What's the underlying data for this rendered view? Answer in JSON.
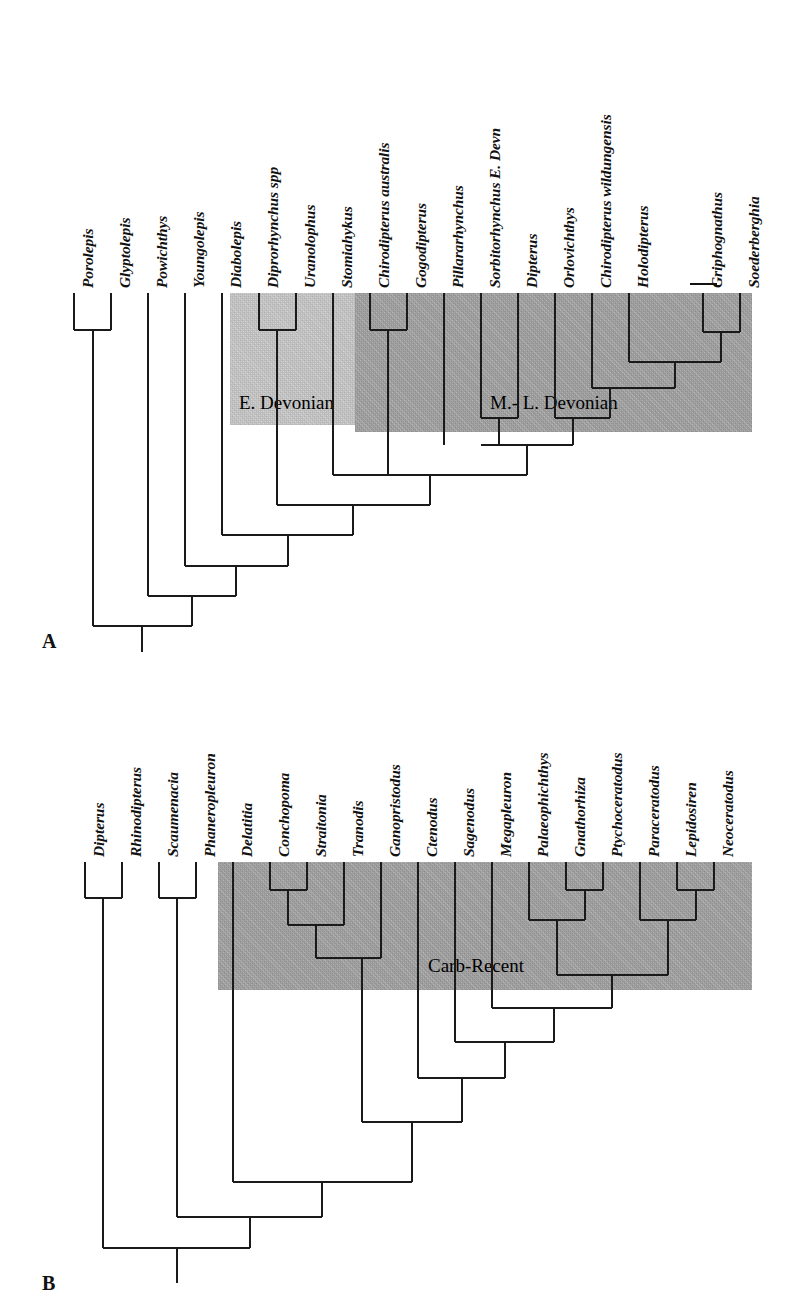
{
  "figure": {
    "type": "cladogram",
    "panels": [
      {
        "letter": "A",
        "letter_pos": {
          "x": 42,
          "y": 630
        },
        "tip_spacing": 37,
        "tip_x0": 74,
        "tip_top": 293,
        "label_baseline_y": 288,
        "taxa": [
          {
            "name": "Porolepis",
            "tip_x": 74,
            "label_y": 288,
            "style": "italic"
          },
          {
            "name": "Glyptolepis",
            "tip_x": 111,
            "label_y": 288,
            "style": "italic"
          },
          {
            "name": "Powichthys",
            "tip_x": 148,
            "label_y": 288,
            "style": "italic"
          },
          {
            "name": "Youngolepis",
            "tip_x": 185,
            "label_y": 288,
            "style": "italic"
          },
          {
            "name": "Diabolepis",
            "tip_x": 222,
            "label_y": 288,
            "style": "italic"
          },
          {
            "name": "Diprorhynchus spp",
            "tip_x": 259,
            "label_y": 288,
            "style": "italic-mixed"
          },
          {
            "name": "Uranolophus",
            "tip_x": 296,
            "label_y": 288,
            "style": "italic"
          },
          {
            "name": "Stomiahykus",
            "tip_x": 333,
            "label_y": 288,
            "style": "italic"
          },
          {
            "name": "Chirodipterus australis",
            "tip_x": 370,
            "label_y": 288,
            "style": "italic"
          },
          {
            "name": "Gogodipterus",
            "tip_x": 407,
            "label_y": 288,
            "style": "italic"
          },
          {
            "name": "Pillararhynchus",
            "tip_x": 444,
            "label_y": 288,
            "style": "italic"
          },
          {
            "name": "Sorbitorhynchus E. Devn",
            "tip_x": 481,
            "label_y": 288,
            "style": "italic-mixed"
          },
          {
            "name": "Dipterus",
            "tip_x": 518,
            "label_y": 288,
            "style": "italic"
          },
          {
            "name": "Orlovichthys",
            "tip_x": 555,
            "label_y": 288,
            "style": "italic"
          },
          {
            "name": "Chirodipterus wildungensis",
            "tip_x": 592,
            "label_y": 288,
            "style": "italic"
          },
          {
            "name": "Holodipterus",
            "tip_x": 629,
            "label_y": 288,
            "style": "italic"
          },
          {
            "name": "Griphognathus",
            "tip_x": 703,
            "label_y": 288,
            "style": "italic"
          },
          {
            "name": "Soederberghia",
            "tip_x": 740,
            "label_y": 288,
            "style": "italic"
          }
        ],
        "bands": [
          {
            "id": "e-devonian",
            "label": "E. Devonian",
            "x": 230,
            "y": 293,
            "w": 125,
            "h": 132,
            "color": "#c9c9c9",
            "label_x": 239,
            "label_y": 392
          },
          {
            "id": "ml-devonian",
            "label": "M.- L. Devonian",
            "x": 355,
            "y": 293,
            "w": 397,
            "h": 139,
            "color": "#a3a3a3",
            "label_x": 490,
            "label_y": 392
          }
        ],
        "bracket": {
          "id": "griphognathus-bracket",
          "x": 690,
          "y": 283,
          "w": 27
        }
      },
      {
        "letter": "B",
        "letter_pos": {
          "x": 42,
          "y": 1272
        },
        "tip_spacing": 37,
        "tip_x0": 85,
        "tip_top": 862,
        "label_baseline_y": 857,
        "taxa": [
          {
            "name": "Dipterus",
            "tip_x": 85,
            "label_y": 857,
            "style": "italic"
          },
          {
            "name": "Rhinodipterus",
            "tip_x": 122,
            "label_y": 857,
            "style": "italic"
          },
          {
            "name": "Scaumenacia",
            "tip_x": 159,
            "label_y": 857,
            "style": "italic"
          },
          {
            "name": "Phaneropleuron",
            "tip_x": 196,
            "label_y": 857,
            "style": "italic"
          },
          {
            "name": "Delatitia",
            "tip_x": 233,
            "label_y": 857,
            "style": "italic"
          },
          {
            "name": "Conchopoma",
            "tip_x": 270,
            "label_y": 857,
            "style": "italic"
          },
          {
            "name": "Straitonia",
            "tip_x": 307,
            "label_y": 857,
            "style": "italic"
          },
          {
            "name": "Tranodis",
            "tip_x": 344,
            "label_y": 857,
            "style": "italic"
          },
          {
            "name": "Ganopristodus",
            "tip_x": 381,
            "label_y": 857,
            "style": "italic"
          },
          {
            "name": "Ctenodus",
            "tip_x": 418,
            "label_y": 857,
            "style": "italic"
          },
          {
            "name": "Sagenodus",
            "tip_x": 455,
            "label_y": 857,
            "style": "italic"
          },
          {
            "name": "Megapleuron",
            "tip_x": 492,
            "label_y": 857,
            "style": "italic"
          },
          {
            "name": "Palaeophichthys",
            "tip_x": 529,
            "label_y": 857,
            "style": "italic"
          },
          {
            "name": "Gnathorhiza",
            "tip_x": 566,
            "label_y": 857,
            "style": "italic"
          },
          {
            "name": "Ptychoceratodus",
            "tip_x": 603,
            "label_y": 857,
            "style": "italic"
          },
          {
            "name": "Paraceratodus",
            "tip_x": 640,
            "label_y": 857,
            "style": "italic"
          },
          {
            "name": "Lepidosiren",
            "tip_x": 677,
            "label_y": 857,
            "style": "italic"
          },
          {
            "name": "Neoceratodus",
            "tip_x": 714,
            "label_y": 857,
            "style": "italic"
          }
        ],
        "bands": [
          {
            "id": "carb-recent",
            "label": "Carb-Recent",
            "x": 218,
            "y": 862,
            "w": 534,
            "h": 128,
            "color": "#a3a3a3",
            "label_x": 428,
            "label_y": 955
          }
        ]
      }
    ]
  },
  "chart_data": {
    "type": "cladogram",
    "title": "",
    "panels": [
      {
        "panel": "A",
        "taxa_order": [
          "Porolepis",
          "Glyptolepis",
          "Powichthys",
          "Youngolepis",
          "Diabolepis",
          "Diprorhynchus spp",
          "Uranolophus",
          "Stomiahykus",
          "Chirodipterus australis",
          "Gogodipterus",
          "Pillararhynchus",
          "Sorbitorhynchus E. Devn",
          "Dipterus",
          "Orlovichthys",
          "Chirodipterus wildungensis",
          "Holodipterus",
          "Griphognathus",
          "Soederberghia"
        ],
        "time_bands": [
          "E. Devonian",
          "M.- L. Devonian"
        ],
        "topology": "(((Porolepis,Glyptolepis),Powichthys),Youngolepis,Diabolepis,((Diprorhynchus spp,Uranolophus),Stomiahykus),Chirodipterus australis,Gogodipterus,Pillararhynchus,Sorbitorhynchus,Dipterus,Orlovichthys,((Chirodipterus wildungensis,(Holodipterus,(Griphognathus,Soederberghia)))))",
        "notes": "Pectinate backbone; Porolepis+Glyptolepis sister pair; Diprorhynchus spp+Uranolophus sister pair; terminal nested clade Chirodipterus wildungensis/Holodipterus/Griphognathus+Soederberghia"
      },
      {
        "panel": "B",
        "taxa_order": [
          "Dipterus",
          "Rhinodipterus",
          "Scaumenacia",
          "Phaneropleuron",
          "Delatitia",
          "Conchopoma",
          "Straitonia",
          "Tranodis",
          "Ganopristodus",
          "Ctenodus",
          "Sagenodus",
          "Megapleuron",
          "Palaeophichthys",
          "Gnathorhiza",
          "Ptychoceratodus",
          "Paraceratodus",
          "Lepidosiren",
          "Neoceratodus"
        ],
        "time_bands": [
          "Carb-Recent"
        ],
        "topology": "((Dipterus,Rhinodipterus),((Scaumenacia,Phaneropleuron),(Delatitia,(((Conchopoma,Straitonia),Tranodis),Ganopristodus),(Ctenodus,(Sagenodus,(Megapleuron,((Palaeophichthys,(Gnathorhiza,Ptychoceratodus)),(Paraceratodus,(Lepidosiren,Neoceratodus)))))))))",
        "notes": "Dipterus+Rhinodipterus basal pair; Scaumenacia+Phaneropleuron pair; Conchopoma+Straitonia sister pair nested with Tranodis and Ganopristodus; Gnathorhiza+Ptychoceratodus pair with Palaeophichthys; Lepidosiren+Neoceratodus pair with Paraceratodus"
      }
    ]
  }
}
